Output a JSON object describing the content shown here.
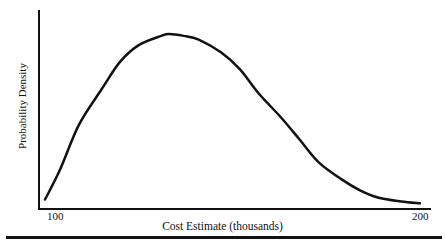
{
  "chart_data": {
    "type": "line",
    "title": "",
    "xlabel": "Cost Estimate (thousands)",
    "ylabel": "Probability Density",
    "xlim": [
      100,
      200
    ],
    "ylim": [
      0,
      1
    ],
    "grid": false,
    "legend": null,
    "x_tick_labels": [
      "100",
      "200"
    ],
    "series": [
      {
        "name": "Cost estimate density (right-skewed)",
        "x": [
          100,
          104,
          109,
          115,
          120,
          125,
          131,
          133,
          137,
          141,
          147,
          152,
          157,
          163,
          168,
          173,
          179,
          184,
          189,
          195,
          200
        ],
        "values": [
          0.04,
          0.2,
          0.44,
          0.63,
          0.78,
          0.87,
          0.92,
          0.93,
          0.92,
          0.9,
          0.83,
          0.74,
          0.61,
          0.48,
          0.36,
          0.24,
          0.15,
          0.09,
          0.05,
          0.03,
          0.02
        ]
      }
    ],
    "annotations": []
  },
  "labels": {
    "ylabel": "Probability Density",
    "xlabel": "Cost Estimate (thousands)",
    "tick_min": "100",
    "tick_max": "200"
  }
}
